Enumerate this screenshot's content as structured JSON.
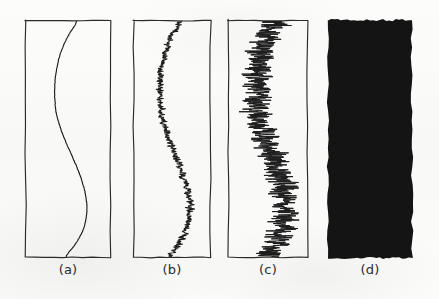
{
  "figure": {
    "caption_style": "handwritten-parenthetical",
    "background_color": "#fbfbfa",
    "ink_color": "#1d1d1d",
    "fill_color": "#141414",
    "panel_count": 4
  },
  "panels": [
    {
      "id": "panel-a",
      "label": "(a)",
      "noise_level": 0,
      "description": "smooth S-shaped curve, no noise",
      "frame": {
        "x": 25,
        "y": 20,
        "width": 86,
        "height": 238
      },
      "label_position": {
        "x": 25,
        "y": 262,
        "width": 86
      }
    },
    {
      "id": "panel-b",
      "label": "(b)",
      "noise_level": 1,
      "description": "same curve with small amplitude noise",
      "frame": {
        "x": 133,
        "y": 20,
        "width": 78,
        "height": 238
      },
      "label_position": {
        "x": 133,
        "y": 262,
        "width": 78
      }
    },
    {
      "id": "panel-c",
      "label": "(c)",
      "noise_level": 2,
      "description": "same curve with large amplitude noise",
      "frame": {
        "x": 228,
        "y": 20,
        "width": 80,
        "height": 238
      },
      "label_position": {
        "x": 228,
        "y": 262,
        "width": 80
      }
    },
    {
      "id": "panel-d",
      "label": "(d)",
      "noise_level": 3,
      "description": "noise so large the panel is saturated solid black",
      "frame": {
        "x": 328,
        "y": 20,
        "width": 84,
        "height": 238
      },
      "label_position": {
        "x": 328,
        "y": 262,
        "width": 84
      }
    }
  ],
  "chart_data": {
    "type": "line",
    "title": "",
    "xlabel": "",
    "ylabel": "",
    "orientation": "vertical",
    "xlim": [
      0,
      1
    ],
    "ylim": [
      0,
      1
    ],
    "grid": false,
    "legend": null,
    "note": "x is horizontal position across panel width (0=left,1=right); y is vertical position down panel height (0=top,1=bottom)",
    "series": [
      {
        "name": "base-curve",
        "appears_in": [
          "panel-a",
          "panel-b",
          "panel-c"
        ],
        "noise_amplitude": 0.0,
        "y": [
          0.0,
          0.05,
          0.1,
          0.15,
          0.2,
          0.25,
          0.3,
          0.35,
          0.4,
          0.45,
          0.5,
          0.55,
          0.6,
          0.65,
          0.7,
          0.75,
          0.8,
          0.85,
          0.9,
          0.95,
          1.0
        ],
        "x": [
          0.6,
          0.52,
          0.45,
          0.4,
          0.37,
          0.35,
          0.345,
          0.35,
          0.37,
          0.41,
          0.46,
          0.52,
          0.58,
          0.635,
          0.68,
          0.71,
          0.72,
          0.705,
          0.66,
          0.58,
          0.48
        ]
      },
      {
        "name": "noisy-curve-low",
        "appears_in": [
          "panel-b"
        ],
        "noise_amplitude": 0.045
      },
      {
        "name": "noisy-curve-high",
        "appears_in": [
          "panel-c"
        ],
        "noise_amplitude": 0.17
      },
      {
        "name": "noisy-curve-saturated",
        "appears_in": [
          "panel-d"
        ],
        "noise_amplitude": 1.5
      }
    ]
  }
}
